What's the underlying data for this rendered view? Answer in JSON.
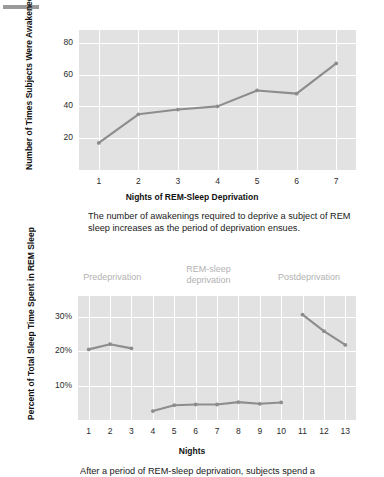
{
  "document": {
    "top_rule": "horizontal-rule"
  },
  "figure1": {
    "y_axis_title": "Number of Times Subjects\nWere Awakened to Enforce\nREM-Sleep Deprivation",
    "x_axis_title": "Nights of REM-Sleep Deprivation",
    "caption": "The number of awakenings required to deprive a subject of REM sleep increases as the period of deprivation ensues.",
    "chart_data": {
      "type": "line",
      "title": "",
      "xlabel": "Nights of REM-Sleep Deprivation",
      "ylabel": "Number of Times Subjects Were Awakened to Enforce REM-Sleep Deprivation",
      "x": [
        1,
        2,
        3,
        4,
        5,
        6,
        7
      ],
      "categories": [
        "1",
        "2",
        "3",
        "4",
        "5",
        "6",
        "7"
      ],
      "values": [
        17,
        35,
        38,
        40,
        50,
        48,
        67
      ],
      "ytick_labels": [
        "80",
        "60",
        "40",
        "20"
      ],
      "yticks": [
        80,
        60,
        40,
        20
      ],
      "ylim": [
        0,
        88
      ],
      "xlim": [
        0.5,
        7.5
      ],
      "grid": true,
      "legend": "none",
      "series_color": "#8d8d8d",
      "plot_background": "#e2e2e2",
      "gridline_color": "#ffffff"
    }
  },
  "figure2": {
    "y_axis_title": "Percent of Total Sleep\nTime Spent in REM Sleep",
    "x_axis_title": "Nights",
    "caption": "After a period of REM-sleep deprivation, subjects spend a",
    "section_labels": [
      {
        "text": "Predeprivation",
        "center_night": 2.1
      },
      {
        "text": "REM-sleep\ndeprivation",
        "center_night": 6.6
      },
      {
        "text": "Postdeprivation",
        "center_night": 11.3
      }
    ],
    "chart_data": {
      "type": "line",
      "title": "",
      "xlabel": "Nights",
      "ylabel": "Percent of Total Sleep Time Spent in REM Sleep",
      "categories": [
        "1",
        "2",
        "3",
        "4",
        "5",
        "6",
        "7",
        "8",
        "9",
        "10",
        "11",
        "12",
        "13"
      ],
      "ytick_labels": [
        "30%",
        "20%",
        "10%"
      ],
      "yticks": [
        30,
        20,
        10
      ],
      "ylim": [
        0,
        36
      ],
      "xlim": [
        0.5,
        13.5
      ],
      "grid": true,
      "legend": "none",
      "series_color": "#8d8d8d",
      "plot_background": "#e2e2e2",
      "gridline_color": "#ffffff",
      "series": [
        {
          "name": "Predeprivation",
          "x": [
            1,
            2,
            3
          ],
          "values": [
            20.5,
            22.0,
            20.8
          ]
        },
        {
          "name": "REM-sleep deprivation",
          "x": [
            4,
            5,
            6,
            7,
            8,
            9,
            10
          ],
          "values": [
            2.6,
            4.3,
            4.5,
            4.5,
            5.2,
            4.7,
            5.1
          ]
        },
        {
          "name": "Postdeprivation",
          "x": [
            11,
            12,
            13
          ],
          "values": [
            30.6,
            25.8,
            21.8
          ]
        }
      ]
    }
  }
}
